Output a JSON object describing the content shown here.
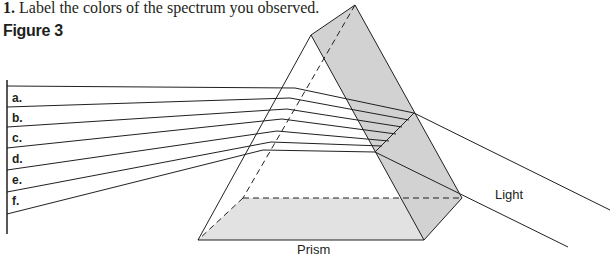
{
  "question": {
    "number": "1.",
    "text": "Label the colors of the spectrum you observed."
  },
  "figure": {
    "title": "Figure 3",
    "blank_labels": [
      "a.",
      "b.",
      "c.",
      "d.",
      "e.",
      "f."
    ],
    "prism_caption": "Prism",
    "light_caption": "Light",
    "colors": {
      "stroke": "#231f20",
      "prism_fill": "#d4d4d4",
      "base_fill": "#e0e0e0",
      "background": "#ffffff"
    }
  }
}
